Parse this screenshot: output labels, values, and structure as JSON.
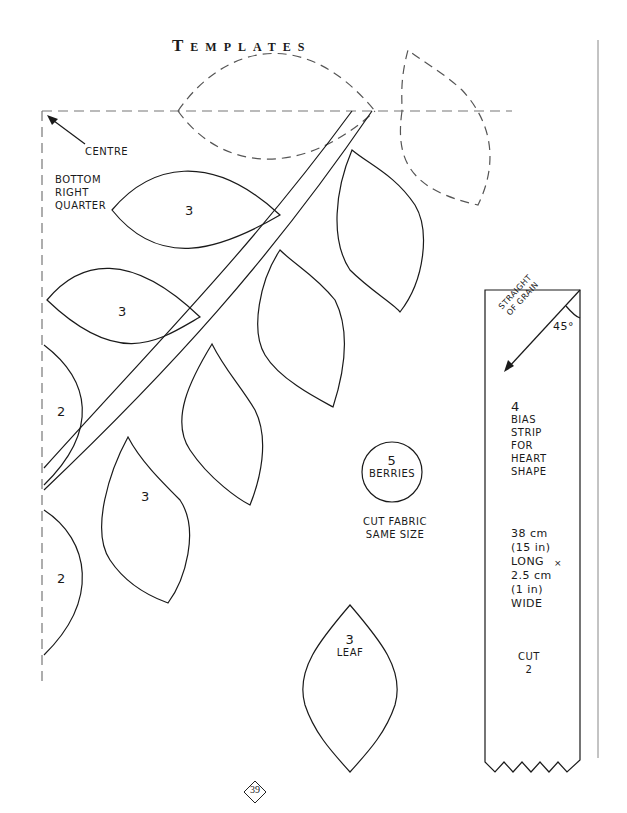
{
  "page": {
    "title": "Templates",
    "page_number": "39"
  },
  "labels": {
    "centre": "CENTRE",
    "quarter": [
      "BOTTOM",
      "RIGHT",
      "QUARTER"
    ]
  },
  "pieces": {
    "leaf_upper_left": "3",
    "leaf_mid_left": "3",
    "leaf_edge_upper": "2",
    "leaf_lower_left": "3",
    "leaf_edge_lower": "2",
    "berries_number": "5",
    "berries_label": "BERRIES",
    "berries_note": [
      "CUT FABRIC",
      "SAME SIZE"
    ],
    "leaf_template_number": "3",
    "leaf_template_label": "LEAF"
  },
  "bias_strip": {
    "grain_label": [
      "STRAIGHT",
      "OF GRAIN"
    ],
    "angle": "45°",
    "number": "4",
    "description": [
      "BIAS",
      "STRIP",
      "FOR",
      "HEART",
      "SHAPE"
    ],
    "size": [
      "38 cm",
      "(15 in)",
      "LONG",
      "2.5 cm",
      "(1 in)",
      "WIDE"
    ],
    "times_mark": "×",
    "cut_label": "CUT",
    "cut_count": "2"
  },
  "colors": {
    "ink": "#1a1a1a",
    "dash": "#777777",
    "margin_rule": "#888888"
  }
}
